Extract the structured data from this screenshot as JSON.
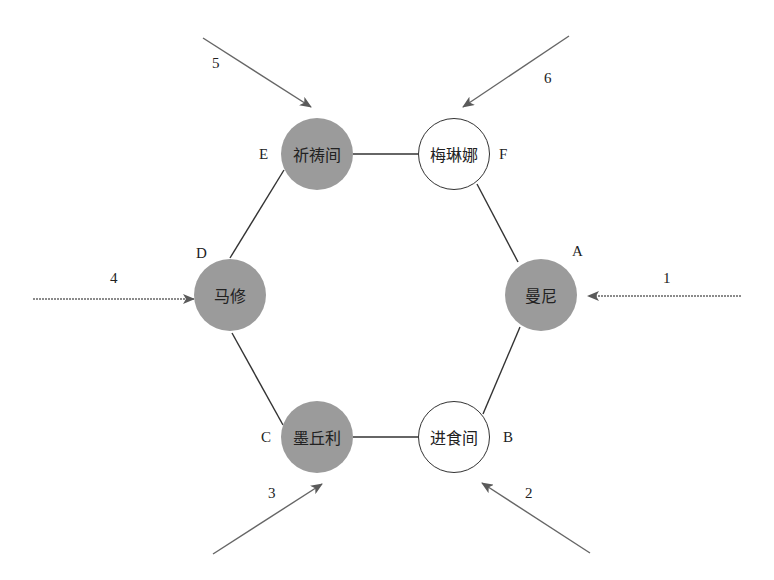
{
  "diagram": {
    "type": "hexagonal-node-graph",
    "colors": {
      "filled_node": "#9b9b9b",
      "open_node": "#ffffff",
      "edge": "#333333",
      "arrow": "#666666"
    },
    "nodes": [
      {
        "id": "A",
        "letter": "A",
        "label": "曼尼",
        "filled": true
      },
      {
        "id": "B",
        "letter": "B",
        "label": "进食间",
        "filled": false
      },
      {
        "id": "C",
        "letter": "C",
        "label": "墨丘利",
        "filled": true
      },
      {
        "id": "D",
        "letter": "D",
        "label": "马修",
        "filled": true
      },
      {
        "id": "E",
        "letter": "E",
        "label": "祈祷间",
        "filled": true
      },
      {
        "id": "F",
        "letter": "F",
        "label": "梅琳娜",
        "filled": false
      }
    ],
    "edges": [
      [
        "A",
        "B"
      ],
      [
        "B",
        "C"
      ],
      [
        "C",
        "D"
      ],
      [
        "D",
        "E"
      ],
      [
        "E",
        "F"
      ],
      [
        "F",
        "A"
      ]
    ],
    "arrows": [
      {
        "label": "1",
        "target": "A"
      },
      {
        "label": "2",
        "target": "B"
      },
      {
        "label": "3",
        "target": "C"
      },
      {
        "label": "4",
        "target": "D"
      },
      {
        "label": "5",
        "target": "E"
      },
      {
        "label": "6",
        "target": "F"
      }
    ]
  }
}
